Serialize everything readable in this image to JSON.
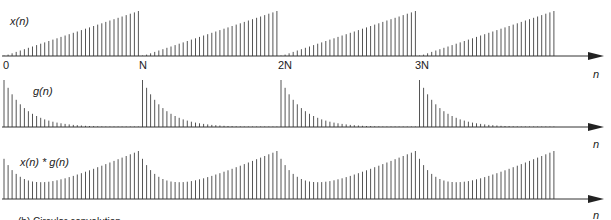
{
  "figure": {
    "panels": [
      {
        "id": "x",
        "label": "x(n)",
        "axis_label": "n",
        "description": "Periodic ramp sequence, period N",
        "tick_labels": [
          "0",
          "N",
          "2N",
          "3N"
        ]
      },
      {
        "id": "g",
        "label": "g(n)",
        "axis_label": "n",
        "description": "Periodic decaying exponential impulse train, period N"
      },
      {
        "id": "xg",
        "label": "x(n) * g(n)",
        "axis_label": "n",
        "description": "Circular convolution of x(n) and g(n)"
      }
    ],
    "caption": "(b) Circular convolution"
  },
  "chart_data": [
    {
      "type": "stem",
      "title": "x(n)",
      "xlabel": "n",
      "x_ticks": [
        "0",
        "N",
        "2N",
        "3N"
      ],
      "periods": 4,
      "samples_per_period": 34,
      "shape": "linear ramp from 0 to max within each period"
    },
    {
      "type": "stem",
      "title": "g(n)",
      "xlabel": "n",
      "periods": 4,
      "samples_per_period": 34,
      "shape": "exponential decay from max at start of each period"
    },
    {
      "type": "stem",
      "title": "x(n) * g(n)",
      "xlabel": "n",
      "periods": 4,
      "samples_per_period": 34,
      "shape": "smoothed ramp: dip after each period boundary, rising to peak at end of period"
    }
  ],
  "colors": {
    "stem": "#555555",
    "axis": "#333333",
    "text": "#222222"
  }
}
